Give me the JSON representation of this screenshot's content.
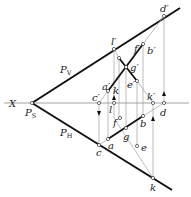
{
  "diagram": {
    "type": "descriptive-geometry projection",
    "axis_label": "X",
    "trace_labels": {
      "vertical_trace": "P",
      "vertical_sub": "V",
      "horizontal_trace": "P",
      "horizontal_sub": "H",
      "vertex": "P",
      "vertex_sub": "S"
    },
    "points_front": {
      "d_prime": "d′",
      "l_prime": "l′",
      "f_prime": "f′",
      "b_prime": "b′",
      "g_prime": "g′",
      "e_prime": "e′",
      "a_prime": "a′",
      "c_prime": "c′",
      "k_prime_upper": "k",
      "k_prime": "k′"
    },
    "points_top": {
      "d": "d",
      "l": "l",
      "f": "f",
      "b": "b",
      "g": "g",
      "a": "a",
      "e": "e",
      "c": "c",
      "k": "k"
    },
    "colors": {
      "bold_line": "#111111",
      "thin_line": "#9a9a9a",
      "axis": "#8a8a8a"
    }
  }
}
